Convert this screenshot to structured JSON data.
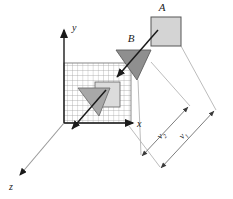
{
  "figure": {
    "title": "",
    "type": "3d-coordinate-motion-diagram",
    "background": "#ffffff"
  },
  "axes": {
    "origin": {
      "x": 64,
      "y": 123
    },
    "labels": {
      "x": "x",
      "y": "y",
      "z": "z"
    },
    "x_axis": {
      "name": "x-axis",
      "from": [
        64,
        123
      ],
      "to": [
        137,
        123
      ],
      "arrow": "end"
    },
    "y_axis": {
      "name": "y-axis",
      "from": [
        64,
        123
      ],
      "to": [
        64,
        26
      ],
      "arrow": "end"
    },
    "z_axis": {
      "name": "z-axis",
      "from": [
        64,
        123
      ],
      "to": [
        16,
        180
      ],
      "arrow": "end"
    }
  },
  "grid_plane": {
    "name": "xy-grid-plane",
    "left": 64,
    "top": 63,
    "width": 67,
    "height": 60,
    "columns": 13,
    "rows": 12,
    "line_color": "#9a9a9a",
    "fill_color": "#ffffff"
  },
  "objects": [
    {
      "id": "A",
      "label": "A",
      "shape": "square",
      "fill": "#d4d4d4",
      "stroke": "#555555",
      "x": 151,
      "y": 17,
      "w": 29,
      "h": 29,
      "label_pos": {
        "x": 163,
        "y": 12
      }
    },
    {
      "id": "B",
      "label": "B",
      "shape": "triangle-arrowhead",
      "fill": "#8f8f8f",
      "stroke": "#5a5a5a",
      "points": "116,50 150,50 137,79",
      "label_pos": {
        "x": 133,
        "y": 38
      }
    },
    {
      "id": "A-projection",
      "label": "",
      "shape": "square",
      "fill": "#dcdcdc",
      "stroke": "#6a6a6a",
      "x": 95,
      "y": 82,
      "w": 24,
      "h": 24
    },
    {
      "id": "B-projection",
      "label": "",
      "shape": "triangle-arrowhead",
      "fill": "#a8a8a8",
      "stroke": "#6a6a6a",
      "points": "78,88 110,88 99,114"
    }
  ],
  "velocity_arrows": [
    {
      "name": "velocity-arrow-upper",
      "from": [
        156,
        31
      ],
      "to": [
        118,
        76
      ],
      "color": "#1a1a1a"
    },
    {
      "name": "velocity-arrow-lower",
      "from": [
        104,
        92
      ],
      "to": [
        73,
        128
      ],
      "color": "#1a1a1a"
    }
  ],
  "dimensions": [
    {
      "id": "v2",
      "label": "v",
      "subscript": "2",
      "name": "dimension-v2",
      "from": [
        141,
        156
      ],
      "to": [
        187,
        108
      ],
      "label_pos": {
        "x": 163,
        "y": 136
      },
      "rotation": -46,
      "color": "#8a8a8a"
    },
    {
      "id": "v1",
      "label": "v",
      "subscript": "1",
      "name": "dimension-v1",
      "from": [
        160,
        168
      ],
      "to": [
        213,
        112
      ],
      "label_pos": {
        "x": 184,
        "y": 136
      },
      "rotation": -46,
      "color": "#8a8a8a"
    }
  ],
  "extension_lines": [
    {
      "name": "ext-line-from-B",
      "from": [
        150,
        63
      ],
      "to": [
        189,
        106
      ]
    },
    {
      "name": "ext-line-from-A",
      "from": [
        181,
        45
      ],
      "to": [
        215,
        110
      ]
    },
    {
      "name": "ext-line-corner-lower-1",
      "from": [
        137,
        79
      ],
      "to": [
        141,
        156
      ]
    },
    {
      "name": "ext-line-corner-lower-2",
      "from": [
        128,
        126
      ],
      "to": [
        160,
        168
      ]
    }
  ],
  "colors": {
    "ink": "#1a1a1a",
    "grid": "#9a9a9a",
    "dimension": "#8a8a8a",
    "object_light": "#d4d4d4",
    "object_dark": "#8f8f8f"
  }
}
